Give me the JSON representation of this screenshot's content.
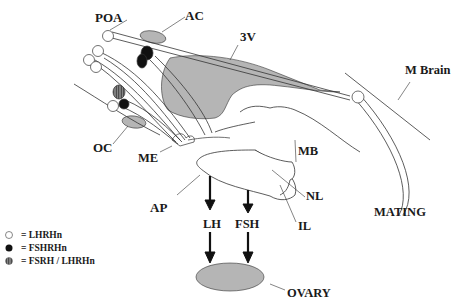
{
  "labels": {
    "poa": "POA",
    "ac": "AC",
    "v3": "3V",
    "mbrain": "M Brain",
    "oc": "OC",
    "me": "ME",
    "mb": "MB",
    "ap": "AP",
    "nl": "NL",
    "il": "IL",
    "mating": "MATING",
    "lh": "LH",
    "fsh": "FSH",
    "ovary": "OVARY"
  },
  "legend": [
    {
      "symbol": "open-circle",
      "label": "= LHRHn"
    },
    {
      "symbol": "filled-circle",
      "label": "= FSHRHn"
    },
    {
      "symbol": "hatched-circle",
      "label": "= FSRH / LHRHn"
    }
  ],
  "colors": {
    "gray_fill": "#b5b5b5",
    "ink": "#1a1a1a"
  }
}
